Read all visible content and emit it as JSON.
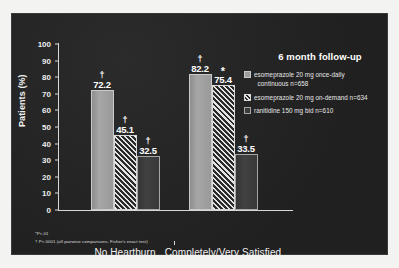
{
  "chart_data": {
    "type": "bar",
    "title": "6 month follow-up",
    "xlabel": "",
    "ylabel": "Patients (%)",
    "ylim": [
      0,
      100
    ],
    "yticks": [
      0,
      10,
      20,
      30,
      40,
      50,
      60,
      70,
      80,
      90,
      100
    ],
    "grid": false,
    "legend_position": "right",
    "categories": [
      "No Heartburn",
      "Completely/Very Satisfied"
    ],
    "series": [
      {
        "name": "esomeprazole 20 mg once-daily continuous n=658",
        "values": [
          72.2,
          82.2
        ],
        "labels": [
          "72.2",
          "82.2"
        ],
        "significance": [
          "†",
          "†"
        ],
        "fill": "solid-gray",
        "color": "#9d9d9d"
      },
      {
        "name": "esomeprazole 20 mg on-demand n=634",
        "values": [
          45.1,
          75.4
        ],
        "labels": [
          "45.1",
          "75.4"
        ],
        "significance": [
          "†",
          "*"
        ],
        "fill": "diagonal-hatch",
        "color": "#e4e4e4"
      },
      {
        "name": "ranitidine 150 mg bid n=610",
        "values": [
          32.5,
          33.5
        ],
        "labels": [
          "32.5",
          "33.5"
        ],
        "significance": [
          "†",
          "†"
        ],
        "fill": "solid-dark",
        "color": "#3b3b3b"
      }
    ],
    "annotations": [
      "*P<.01",
      "† P<.0001 (all pairwise comparisons, Fisher's exact test)"
    ]
  },
  "legend": {
    "title": "6 month follow-up",
    "items": [
      {
        "label_line1": "esomeprazole 20 mg once-daily",
        "label_line2": "continuous n=658"
      },
      {
        "label_line1": "esomeprazole 20 mg on-demand n=634",
        "label_line2": ""
      },
      {
        "label_line1": "ranitidine 150 mg bid n=610",
        "label_line2": ""
      }
    ]
  },
  "axes": {
    "ylabel": "Patients (%)",
    "yticks": [
      "100",
      "90",
      "80",
      "70",
      "60",
      "50",
      "40",
      "30",
      "20",
      "10",
      "0"
    ],
    "categories": [
      "No Heartburn",
      "Completely/Very Satisfied"
    ]
  },
  "footnotes": {
    "line1": "*P<.01",
    "line2": "† P<.0001 (all pairwise comparisons, Fisher's exact test)"
  },
  "colors": {
    "panel_background": "#232323",
    "slide_background": "#f3f3f1",
    "axis": "#d8d8d8",
    "text": "#ffffff",
    "series0": "#9d9d9d",
    "series1": "#e4e4e4",
    "series2": "#3b3b3b"
  }
}
